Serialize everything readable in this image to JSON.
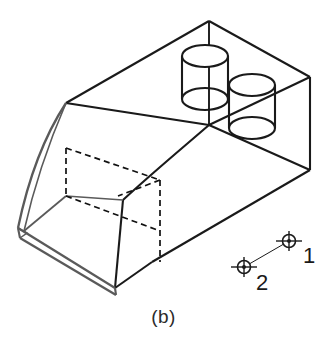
{
  "figure": {
    "caption": "(b)",
    "type": "isometric-engineering-drawing",
    "colors": {
      "visible_edge": "#1a1a1a",
      "hidden_edge": "#111111",
      "highlight_edge": "#5a5a5a",
      "background": "#ffffff",
      "text": "#1a1a1a"
    },
    "line_weights": {
      "visible": 2.1,
      "hidden": 1.8,
      "thin": 1.0
    }
  },
  "datum_targets": [
    {
      "id": "datum-target-1",
      "label": "1",
      "cx": 289,
      "cy": 241,
      "label_x": 303,
      "label_y": 263
    },
    {
      "id": "datum-target-2",
      "label": "2",
      "cx": 244,
      "cy": 267,
      "label_x": 256,
      "label_y": 290
    }
  ],
  "cylinders": [
    {
      "id": "cylinder-left",
      "cx": 205,
      "top_cy": 56,
      "bottom_cy": 99,
      "rx": 23,
      "ry": 11
    },
    {
      "id": "cylinder-right",
      "cx": 252,
      "top_cy": 85,
      "bottom_cy": 128,
      "rx": 23,
      "ry": 11
    }
  ],
  "geometry": {
    "apex_top": {
      "x": 209,
      "y": 21
    },
    "rear_right_top": {
      "x": 310,
      "y": 77
    },
    "rear_right_bottom": {
      "x": 310,
      "y": 170
    },
    "front_bottom_tip": {
      "x": 18,
      "y": 228
    },
    "front_bottom_vertex": {
      "x": 115,
      "y": 288
    }
  }
}
